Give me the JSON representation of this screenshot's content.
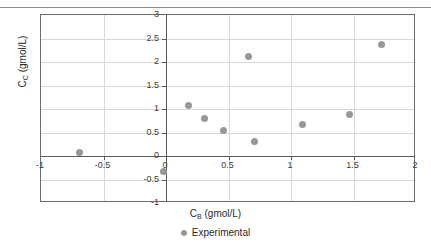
{
  "chart_data": {
    "type": "scatter",
    "title": "",
    "xlabel": "C_B (gmol/L)",
    "ylabel": "C_C (gmol/L)",
    "xlabel_base": "C",
    "xlabel_sub": "B",
    "xlabel_units": " (gmol/L)",
    "ylabel_base": "C",
    "ylabel_sub": "C",
    "ylabel_units": " (gmol/L)",
    "xlim": [
      -1,
      2
    ],
    "ylim": [
      -1,
      3
    ],
    "xticks": [
      -1,
      -0.5,
      0,
      0.5,
      1,
      1.5,
      2
    ],
    "yticks": [
      -1,
      -0.5,
      0,
      0.5,
      1,
      1.5,
      2,
      2.5,
      3
    ],
    "xticklabels": [
      "-1",
      "-0.5",
      "0",
      "0.5",
      "1",
      "1.5",
      "2"
    ],
    "yticklabels": [
      "-1",
      "-0.5",
      "0",
      "0.5",
      "1",
      "1.5",
      "2",
      "2.5",
      "3"
    ],
    "grid": true,
    "legend_position": "bottom-center",
    "marker_color": "#989898",
    "frame_color": "#6e6e6e",
    "grid_color": "#d8d8d8",
    "axis_color": "#5a5a5a",
    "series": [
      {
        "name": "Experimental",
        "marker": "circle",
        "color": "#989898",
        "points": [
          {
            "x": -0.69,
            "y": 0.08
          },
          {
            "x": -0.02,
            "y": -0.33
          },
          {
            "x": 0.18,
            "y": 1.08
          },
          {
            "x": 0.31,
            "y": 0.79
          },
          {
            "x": 0.46,
            "y": 0.54
          },
          {
            "x": 0.66,
            "y": 2.11
          },
          {
            "x": 0.71,
            "y": 0.3
          },
          {
            "x": 1.09,
            "y": 0.66
          },
          {
            "x": 1.47,
            "y": 0.88
          },
          {
            "x": 1.72,
            "y": 2.37
          }
        ]
      }
    ]
  },
  "legend": {
    "entries": [
      {
        "label": "Experimental",
        "marker": "circle-marker-icon",
        "color": "#989898"
      }
    ]
  }
}
